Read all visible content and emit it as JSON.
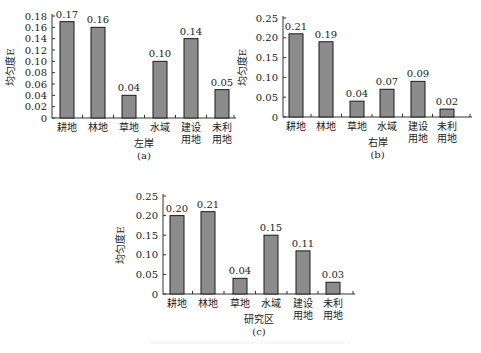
{
  "chart_data": [
    {
      "id": "a",
      "type": "bar",
      "title": "",
      "xlabel": "左岸",
      "panel_label": "(a)",
      "ylabel": "均匀度E",
      "categories": [
        "耕地",
        "林地",
        "草地",
        "水域",
        "建设用地",
        "未利用地"
      ],
      "category_lines": [
        [
          "耕地"
        ],
        [
          "林地"
        ],
        [
          "草地"
        ],
        [
          "水域"
        ],
        [
          "建设",
          "用地"
        ],
        [
          "未利",
          "用地"
        ]
      ],
      "values": [
        0.17,
        0.16,
        0.04,
        0.1,
        0.14,
        0.05
      ],
      "value_labels": [
        "0.17",
        "0.16",
        "0.04",
        "0.10",
        "0.14",
        "0.05"
      ],
      "yticks": [
        "0",
        "0.02",
        "0.04",
        "0.06",
        "0.08",
        "0.10",
        "0.12",
        "0.14",
        "0.16",
        "0.18"
      ],
      "ylim": [
        0,
        0.18
      ],
      "grid": false
    },
    {
      "id": "b",
      "type": "bar",
      "title": "",
      "xlabel": "右岸",
      "panel_label": "(b)",
      "ylabel": "均匀度E",
      "categories": [
        "耕地",
        "林地",
        "草地",
        "水域",
        "建设用地",
        "未利用地"
      ],
      "category_lines": [
        [
          "耕地"
        ],
        [
          "林地"
        ],
        [
          "草地"
        ],
        [
          "水域"
        ],
        [
          "建设",
          "用地"
        ],
        [
          "未利",
          "用地"
        ]
      ],
      "values": [
        0.21,
        0.19,
        0.04,
        0.07,
        0.09,
        0.02
      ],
      "value_labels": [
        "0.21",
        "0.19",
        "0.04",
        "0.07",
        "0.09",
        "0.02"
      ],
      "yticks": [
        "0",
        "0.05",
        "0.10",
        "0.15",
        "0.20",
        "0.25"
      ],
      "ylim": [
        0,
        0.25
      ],
      "grid": false
    },
    {
      "id": "c",
      "type": "bar",
      "title": "",
      "xlabel": "研究区",
      "panel_label": "(c)",
      "ylabel": "均匀度E",
      "categories": [
        "耕地",
        "林地",
        "草地",
        "水域",
        "建设用地",
        "未利用地"
      ],
      "category_lines": [
        [
          "耕地"
        ],
        [
          "林地"
        ],
        [
          "草地"
        ],
        [
          "水域"
        ],
        [
          "建设",
          "用地"
        ],
        [
          "未利",
          "用地"
        ]
      ],
      "values": [
        0.2,
        0.21,
        0.04,
        0.15,
        0.11,
        0.03
      ],
      "value_labels": [
        "0.20",
        "0.21",
        "0.04",
        "0.15",
        "0.11",
        "0.03"
      ],
      "yticks": [
        "0",
        "0.05",
        "0.10",
        "0.15",
        "0.20",
        "0.25"
      ],
      "ylim": [
        0,
        0.25
      ],
      "grid": false
    }
  ],
  "style": {
    "bar_fill": "#8c8c8c",
    "bar_stroke": "#1a1a1a",
    "axis_color": "#333333"
  }
}
